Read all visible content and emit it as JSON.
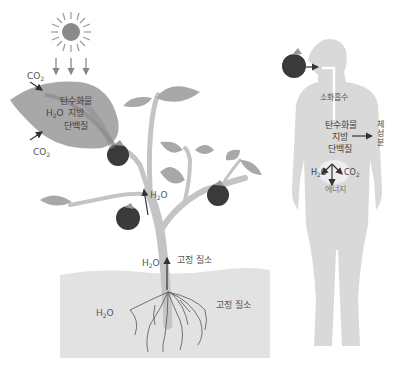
{
  "diagram": {
    "type": "nutrient-flow-illustration",
    "colors": {
      "sun": "#8a8a8a",
      "leaf": "#a8a8a8",
      "leaf_vein": "#8c8c8c",
      "stem": "#c4c4c4",
      "fruit": "#3a3a3a",
      "soil": "#e2e2e2",
      "root": "#555555",
      "body": "#d9d9d9",
      "arrow": "#333333"
    },
    "plant": {
      "leaf_inputs": {
        "co2_top": {
          "formula": "CO",
          "subscript": "2"
        },
        "co2_bottom": {
          "formula": "CO",
          "subscript": "2"
        }
      },
      "leaf_products": {
        "carbohydrate": "탄수화물",
        "water": {
          "formula": "H",
          "subscript": "2",
          "suffix": "O"
        },
        "fat": "지방",
        "protein": "단백질"
      },
      "stem_water_upper": {
        "formula": "H",
        "subscript": "2",
        "suffix": "O"
      },
      "stem_water_lower": {
        "formula": "H",
        "subscript": "2",
        "suffix": "O"
      },
      "stem_nitrogen": "고정 질소",
      "soil_water": {
        "formula": "H",
        "subscript": "2",
        "suffix": "O"
      },
      "soil_nitrogen": "고정 질소"
    },
    "human": {
      "digestion": "소화흡수",
      "nutrients": [
        "탄수화물",
        "지방",
        "단백질"
      ],
      "body_composition": "체성분",
      "outputs": {
        "water": {
          "formula": "H",
          "subscript": "2",
          "suffix": "O"
        },
        "co2": {
          "formula": "CO",
          "subscript": "2"
        },
        "energy": "에너지"
      }
    }
  }
}
